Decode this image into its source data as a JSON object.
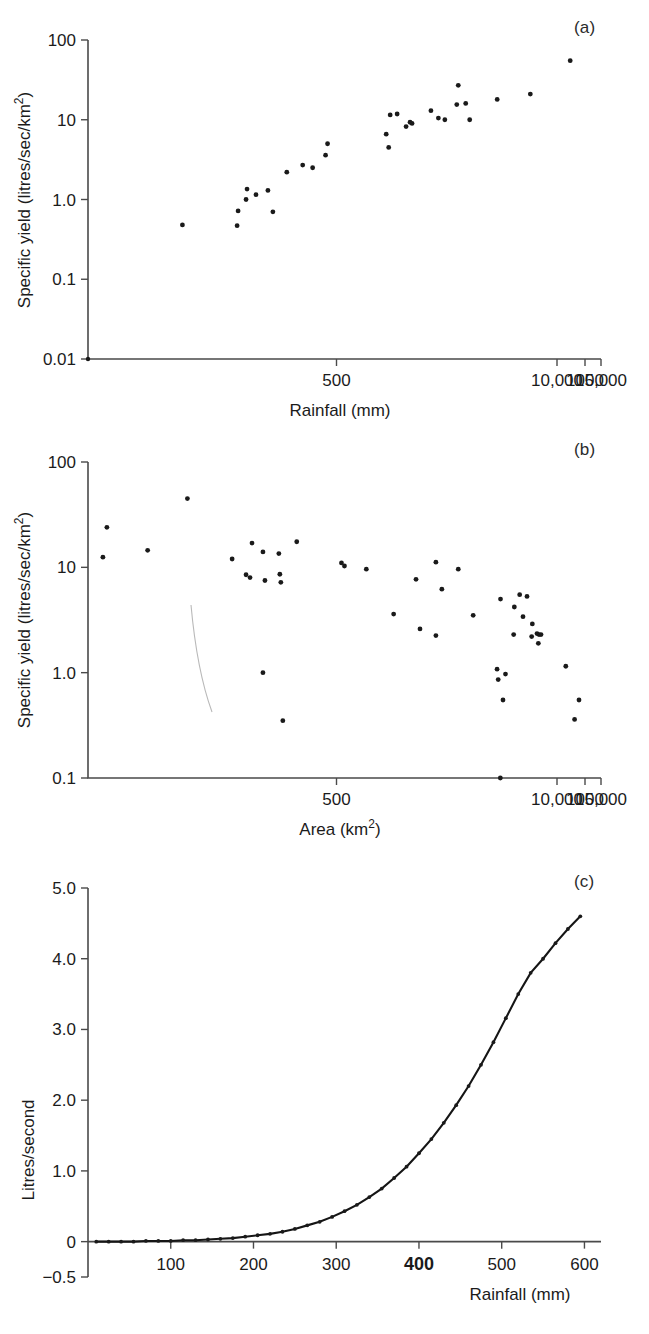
{
  "figure": {
    "background": "#ffffff",
    "ink": "#1a1a1a",
    "panel_labels": [
      "(a)",
      "(b)",
      "(c)"
    ]
  },
  "chart_data": [
    {
      "panel": "(a)",
      "type": "scatter",
      "title": "",
      "xlabel": "Rainfall (mm)",
      "ylabel": "Specific yield (litres/sec/km²)",
      "ylabel_parts": {
        "main": "Specific yield (litres/sec/km",
        "sup": "2",
        "tail": ")"
      },
      "xscale": "log-broken",
      "yscale": "log",
      "grid": false,
      "legend": "none",
      "xticks": [
        "500",
        "1000",
        "10,000",
        "15,000"
      ],
      "xtick_positions": [
        500,
        1000,
        10000,
        15000
      ],
      "yticks": [
        "0.01",
        "0.1",
        "1.0",
        "10",
        "100"
      ],
      "ytick_values": [
        0.01,
        0.1,
        1.0,
        10,
        100
      ],
      "ylim": [
        0.01,
        100
      ],
      "points": [
        {
          "x": 190,
          "y": 0.48
        },
        {
          "x": 300,
          "y": 0.47
        },
        {
          "x": 302,
          "y": 0.72
        },
        {
          "x": 318,
          "y": 1.0
        },
        {
          "x": 320,
          "y": 1.35
        },
        {
          "x": 338,
          "y": 1.15
        },
        {
          "x": 362,
          "y": 1.3
        },
        {
          "x": 372,
          "y": 0.7
        },
        {
          "x": 400,
          "y": 2.2
        },
        {
          "x": 432,
          "y": 2.7
        },
        {
          "x": 452,
          "y": 2.5
        },
        {
          "x": 478,
          "y": 3.6
        },
        {
          "x": 482,
          "y": 5.0
        },
        {
          "x": 600,
          "y": 6.6
        },
        {
          "x": 605,
          "y": 4.5
        },
        {
          "x": 608,
          "y": 11.5
        },
        {
          "x": 622,
          "y": 11.8
        },
        {
          "x": 640,
          "y": 8.2
        },
        {
          "x": 648,
          "y": 9.3
        },
        {
          "x": 652,
          "y": 9.0
        },
        {
          "x": 690,
          "y": 13.0
        },
        {
          "x": 705,
          "y": 10.5
        },
        {
          "x": 718,
          "y": 10.0
        },
        {
          "x": 745,
          "y": 27.0
        },
        {
          "x": 742,
          "y": 15.5
        },
        {
          "x": 760,
          "y": 16.0
        },
        {
          "x": 768,
          "y": 10.0
        },
        {
          "x": 1030,
          "y": 18.0
        },
        {
          "x": 6000,
          "y": 21.0
        },
        {
          "x": 11500,
          "y": 55.0
        }
      ]
    },
    {
      "panel": "(b)",
      "type": "scatter",
      "title": "",
      "xlabel": "Area (km²)",
      "xlabel_parts": {
        "main": "Area (km",
        "sup": "2",
        "tail": ")"
      },
      "ylabel": "Specific yield (litres/sec/km²)",
      "ylabel_parts": {
        "main": "Specific yield (litres/sec/km",
        "sup": "2",
        "tail": ")"
      },
      "xscale": "log-broken",
      "yscale": "log",
      "grid": false,
      "legend": "none",
      "xticks": [
        "500",
        "1000",
        "10,000",
        "15,000"
      ],
      "xtick_positions": [
        500,
        1000,
        10000,
        15000
      ],
      "yticks": [
        "0.1",
        "1.0",
        "10",
        "100"
      ],
      "ytick_values": [
        0.1,
        1.0,
        10,
        100
      ],
      "ylim": [
        0.1,
        100
      ],
      "points": [
        {
          "x": 30,
          "y": 12.5
        },
        {
          "x": 38,
          "y": 24.0
        },
        {
          "x": 120,
          "y": 14.5
        },
        {
          "x": 200,
          "y": 45.0
        },
        {
          "x": 290,
          "y": 12.0
        },
        {
          "x": 330,
          "y": 17.0
        },
        {
          "x": 318,
          "y": 8.5
        },
        {
          "x": 326,
          "y": 8.0
        },
        {
          "x": 352,
          "y": 14.0
        },
        {
          "x": 356,
          "y": 7.5
        },
        {
          "x": 384,
          "y": 13.5
        },
        {
          "x": 386,
          "y": 8.6
        },
        {
          "x": 388,
          "y": 7.2
        },
        {
          "x": 420,
          "y": 17.5
        },
        {
          "x": 352,
          "y": 1.0
        },
        {
          "x": 392,
          "y": 0.35
        },
        {
          "x": 510,
          "y": 11.0
        },
        {
          "x": 516,
          "y": 10.3
        },
        {
          "x": 560,
          "y": 9.6
        },
        {
          "x": 615,
          "y": 3.6
        },
        {
          "x": 660,
          "y": 7.7
        },
        {
          "x": 668,
          "y": 2.6
        },
        {
          "x": 700,
          "y": 11.2
        },
        {
          "x": 712,
          "y": 6.2
        },
        {
          "x": 700,
          "y": 2.25
        },
        {
          "x": 745,
          "y": 9.6
        },
        {
          "x": 775,
          "y": 3.5
        },
        {
          "x": 830,
          "y": 5.0
        },
        {
          "x": 840,
          "y": 0.97
        },
        {
          "x": 835,
          "y": 0.55
        },
        {
          "x": 1010,
          "y": 1.08
        },
        {
          "x": 1180,
          "y": 0.86
        },
        {
          "x": 1500,
          "y": 0.1
        },
        {
          "x": 3600,
          "y": 4.2
        },
        {
          "x": 3500,
          "y": 2.3
        },
        {
          "x": 4400,
          "y": 5.5
        },
        {
          "x": 5500,
          "y": 5.3
        },
        {
          "x": 4900,
          "y": 3.4
        },
        {
          "x": 6300,
          "y": 2.9
        },
        {
          "x": 6200,
          "y": 2.2
        },
        {
          "x": 7000,
          "y": 2.35
        },
        {
          "x": 7300,
          "y": 2.3
        },
        {
          "x": 7600,
          "y": 2.3
        },
        {
          "x": 7200,
          "y": 1.9
        },
        {
          "x": 11000,
          "y": 1.15
        },
        {
          "x": 12500,
          "y": 0.55
        },
        {
          "x": 12000,
          "y": 0.36
        }
      ],
      "annotation_curve": "thin grey arc near x=430"
    },
    {
      "panel": "(c)",
      "type": "line",
      "title": "",
      "xlabel": "Rainfall (mm)",
      "ylabel": "Litres/second",
      "xscale": "linear",
      "yscale": "linear",
      "grid": false,
      "legend": "none",
      "markers": true,
      "xticks": [
        "100",
        "200",
        "300",
        "400",
        "500",
        "600"
      ],
      "xtick_values": [
        100,
        200,
        300,
        400,
        500,
        600
      ],
      "bold_xtick": "400",
      "yticks": [
        "-0.5",
        "0",
        "1.0",
        "2.0",
        "3.0",
        "4.0",
        "5.0"
      ],
      "ytick_values": [
        -0.5,
        0,
        1.0,
        2.0,
        3.0,
        4.0,
        5.0
      ],
      "xlim": [
        0,
        620
      ],
      "ylim": [
        -0.5,
        5.0
      ],
      "x": [
        10,
        25,
        40,
        55,
        70,
        85,
        100,
        115,
        130,
        145,
        160,
        175,
        190,
        205,
        220,
        235,
        250,
        265,
        280,
        295,
        310,
        325,
        340,
        355,
        370,
        385,
        400,
        415,
        430,
        445,
        460,
        475,
        490,
        505,
        520,
        535,
        550,
        565,
        580,
        595
      ],
      "values": [
        0.0,
        0.0,
        0.0,
        0.0,
        0.01,
        0.01,
        0.01,
        0.02,
        0.02,
        0.03,
        0.04,
        0.05,
        0.07,
        0.09,
        0.11,
        0.14,
        0.18,
        0.23,
        0.28,
        0.35,
        0.43,
        0.52,
        0.63,
        0.75,
        0.9,
        1.06,
        1.25,
        1.45,
        1.68,
        1.93,
        2.2,
        2.5,
        2.82,
        3.16,
        3.5,
        3.8,
        4.0,
        4.22,
        4.42,
        4.6
      ]
    }
  ]
}
